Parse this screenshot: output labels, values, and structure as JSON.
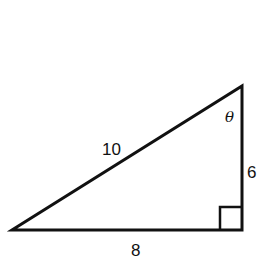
{
  "diagram": {
    "type": "right-triangle",
    "stroke_color": "#111111",
    "background": "#ffffff",
    "vertices": {
      "left": [
        12,
        230
      ],
      "right_angle": [
        242,
        230
      ],
      "top": [
        242,
        86
      ]
    },
    "labels": {
      "hypotenuse": "10",
      "vertical_leg": "6",
      "horizontal_leg": "8",
      "angle": "θ"
    },
    "right_angle_marker": true
  }
}
